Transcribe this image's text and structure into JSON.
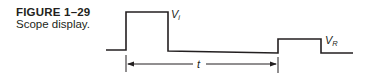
{
  "figure": {
    "label": "FIGURE 1–29",
    "caption": "Scope display."
  },
  "diagram": {
    "type": "oscilloscope-waveform",
    "stroke_color": "#231f20",
    "labels": {
      "incident_pulse": {
        "main": "V",
        "sub": "i"
      },
      "reflected_pulse": {
        "main": "V",
        "sub": "R"
      },
      "time_interval": "t"
    },
    "waveform_points": [
      [
        106,
        50
      ],
      [
        126,
        50
      ],
      [
        126,
        12
      ],
      [
        168,
        12
      ],
      [
        168,
        51
      ],
      [
        278,
        53
      ],
      [
        278,
        39
      ],
      [
        321,
        39
      ],
      [
        321,
        53
      ],
      [
        353,
        53
      ]
    ],
    "time_arrow": {
      "x_start": 126,
      "x_end": 278,
      "y": 64
    }
  }
}
